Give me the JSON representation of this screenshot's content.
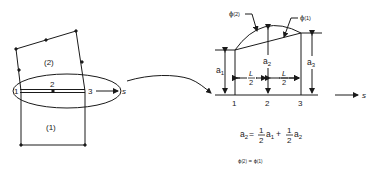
{
  "left_figure": {
    "element_upper_label": "(2)",
    "element_lower_label": "(1)",
    "edge_nodes": [
      "1",
      "2",
      "3"
    ],
    "axis_label": "s"
  },
  "right_figure": {
    "curve_label_quadratic": "ϕ",
    "curve_label_quadratic_sub": "(2)",
    "curve_label_linear": "ϕ",
    "curve_label_linear_sub": "(1)",
    "dim_a1": "a",
    "dim_a1_sub": "1",
    "dim_a2": "a",
    "dim_a2_sub": "2",
    "dim_a3": "a",
    "dim_a3_sub": "3",
    "half_length_num": "L",
    "half_length_den": "2",
    "nodes": [
      "1",
      "2",
      "3"
    ],
    "axis_label": "s"
  },
  "equations": {
    "constraint_lhs": "a",
    "constraint_lhs_sub": "2",
    "equals": "=",
    "frac_num": "1",
    "frac_den": "2",
    "term1": "a",
    "term1_sub": "1",
    "plus": "+",
    "term2": "a",
    "term2_sub": "2",
    "continuity": "ϕ",
    "continuity_sub_left": "(2)",
    "continuity_eq": " = ",
    "continuity_right": "ϕ",
    "continuity_sub_right": "(1)"
  },
  "colors": {
    "stroke": "#1a1a1a",
    "background": "#ffffff"
  }
}
